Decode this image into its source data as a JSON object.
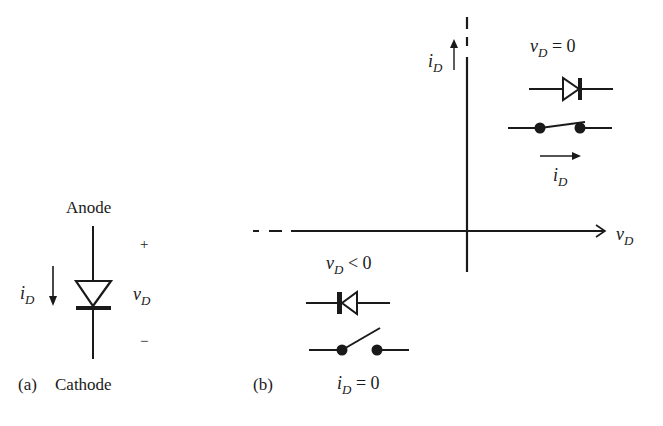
{
  "figure": {
    "panel_a": {
      "tag": "(a)",
      "anode_label": "Anode",
      "cathode_label": "Cathode",
      "plus_sign": "+",
      "minus_sign": "−",
      "current_symbol": "i",
      "current_subscript": "D",
      "voltage_symbol": "v",
      "voltage_subscript": "D"
    },
    "panel_b": {
      "tag": "(b)",
      "x_axis_label": "v",
      "x_axis_subscript": "D",
      "y_axis_label": "i",
      "y_axis_subscript": "D",
      "on_state": {
        "condition_var": "v",
        "condition_sub": "D",
        "condition_rest": " = 0",
        "switch_state": "closed",
        "current_var": "i",
        "current_sub": "D"
      },
      "off_state": {
        "condition_var": "v",
        "condition_sub": "D",
        "condition_rest": " < 0",
        "switch_state": "open",
        "current_var": "i",
        "current_sub": "D",
        "current_rest": " = 0"
      }
    },
    "colors": {
      "ink": "#1a1a1a",
      "background": "#ffffff"
    }
  }
}
